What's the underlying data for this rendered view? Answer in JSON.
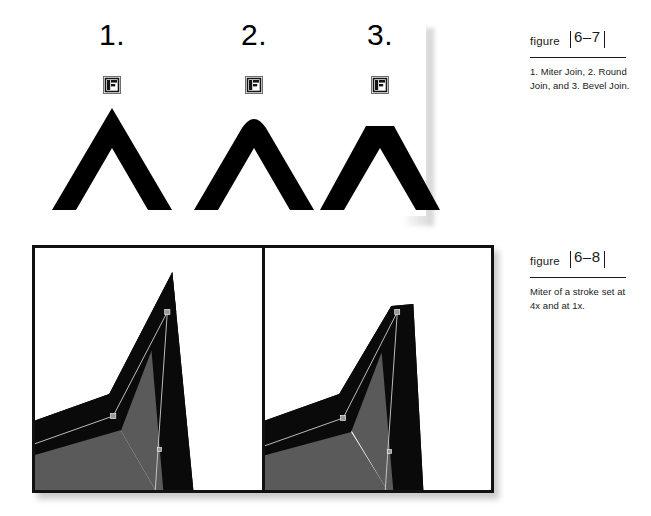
{
  "figure_joins": {
    "items": [
      {
        "number": "1.",
        "icon": "stroke-join-swatch-icon",
        "join_type": "miter"
      },
      {
        "number": "2.",
        "icon": "stroke-join-swatch-icon",
        "join_type": "round"
      },
      {
        "number": "3.",
        "icon": "stroke-join-swatch-icon",
        "join_type": "bevel"
      }
    ]
  },
  "figure_miter": {
    "panels": [
      {
        "label": "miter-4x",
        "fill_color": "#5a5a5a",
        "stroke_color": "#000000"
      },
      {
        "label": "miter-1x",
        "fill_color": "#5a5a5a",
        "stroke_color": "#000000"
      }
    ]
  },
  "captions": [
    {
      "word": "figure",
      "number": "6–7",
      "body": "1. Miter Join, 2. Round Join, and 3. Bevel Join."
    },
    {
      "word": "figure",
      "number": "6–8",
      "body": "Miter of a stroke set at 4x and at 1x."
    }
  ],
  "colors": {
    "ink": "#000000",
    "gray_fill": "#5a5a5a",
    "page": "#ffffff",
    "shadow": "#787878"
  }
}
